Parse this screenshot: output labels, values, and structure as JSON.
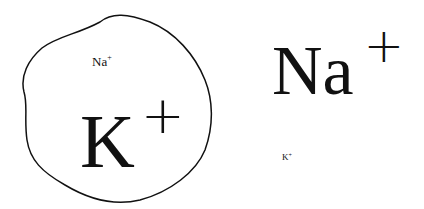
{
  "diagram": {
    "cell": {
      "shape": "irregular-closed-outline",
      "labels": {
        "minor_ion": {
          "symbol": "Na",
          "charge": "+"
        },
        "major_ion": {
          "symbol": "K",
          "charge": "+"
        }
      }
    },
    "outside": {
      "labels": {
        "major_ion": {
          "symbol": "Na",
          "charge": "+"
        },
        "minor_ion": {
          "symbol": "K",
          "charge": "+"
        }
      }
    },
    "colors": {
      "stroke": "#111111",
      "background": "#ffffff"
    }
  }
}
